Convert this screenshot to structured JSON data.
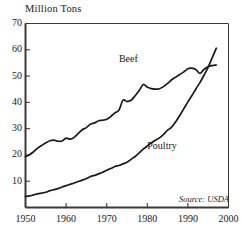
{
  "chart_data": {
    "type": "line",
    "title": "Million Tons",
    "ylabel": "Million Tons",
    "xlabel": "",
    "xlim": [
      1950,
      2000
    ],
    "ylim": [
      0,
      70
    ],
    "ytick_labels": [
      "70",
      "60",
      "50",
      "40",
      "30",
      "20",
      "10"
    ],
    "ytick_values": [
      70,
      60,
      50,
      40,
      30,
      20,
      10
    ],
    "xtick_labels": [
      "1950",
      "1960",
      "1970",
      "1980",
      "1990",
      "2000"
    ],
    "xtick_values": [
      1950,
      1960,
      1970,
      1980,
      1990,
      2000
    ],
    "grid": false,
    "legend_position": "inline-labels",
    "annotations": [
      "Source: USDA"
    ],
    "source_note": "Source: USDA",
    "line_color": "#1a1a1a",
    "axis_color": "#3a3a3a",
    "background": "#ffffff",
    "series": [
      {
        "name": "Beef",
        "label": "Beef",
        "label_x": 1973,
        "label_y": 56,
        "x": [
          1950,
          1951,
          1952,
          1953,
          1954,
          1955,
          1956,
          1957,
          1958,
          1959,
          1960,
          1961,
          1962,
          1963,
          1964,
          1965,
          1966,
          1967,
          1968,
          1969,
          1970,
          1971,
          1972,
          1973,
          1974,
          1975,
          1976,
          1977,
          1978,
          1979,
          1980,
          1981,
          1982,
          1983,
          1984,
          1985,
          1986,
          1987,
          1988,
          1989,
          1990,
          1991,
          1992,
          1993,
          1994,
          1995,
          1996,
          1997
        ],
        "values": [
          19.4,
          20.1,
          21.2,
          22.6,
          23.6,
          24.6,
          25.4,
          25.6,
          25.2,
          25.3,
          26.4,
          26.0,
          26.7,
          28.2,
          29.6,
          30.4,
          31.7,
          32.2,
          33.0,
          33.2,
          33.6,
          34.6,
          36.0,
          37.0,
          40.8,
          40.3,
          40.8,
          42.5,
          44.5,
          46.8,
          45.8,
          45.2,
          45.0,
          45.2,
          46.0,
          47.2,
          48.6,
          49.6,
          50.6,
          51.6,
          52.8,
          53.0,
          52.4,
          51.0,
          52.6,
          53.6,
          54.0,
          54.2
        ]
      },
      {
        "name": "Poultry",
        "label": "Poultry",
        "label_x": 1980,
        "label_y": 23,
        "x": [
          1950,
          1951,
          1952,
          1953,
          1954,
          1955,
          1956,
          1957,
          1958,
          1959,
          1960,
          1961,
          1962,
          1963,
          1964,
          1965,
          1966,
          1967,
          1968,
          1969,
          1970,
          1971,
          1972,
          1973,
          1974,
          1975,
          1976,
          1977,
          1978,
          1979,
          1980,
          1981,
          1982,
          1983,
          1984,
          1985,
          1986,
          1987,
          1988,
          1989,
          1990,
          1991,
          1992,
          1993,
          1994,
          1995,
          1996,
          1997
        ],
        "values": [
          4.2,
          4.4,
          4.8,
          5.2,
          5.5,
          5.8,
          6.4,
          6.8,
          7.2,
          7.8,
          8.3,
          8.8,
          9.3,
          9.9,
          10.4,
          11.0,
          11.8,
          12.2,
          12.8,
          13.4,
          14.2,
          14.8,
          15.6,
          16.0,
          16.6,
          17.2,
          18.3,
          19.4,
          20.8,
          22.2,
          23.4,
          24.6,
          25.6,
          26.5,
          27.8,
          29.4,
          30.6,
          32.6,
          35.0,
          37.6,
          40.2,
          42.6,
          45.2,
          47.6,
          50.4,
          53.4,
          57.0,
          60.6
        ]
      }
    ]
  }
}
